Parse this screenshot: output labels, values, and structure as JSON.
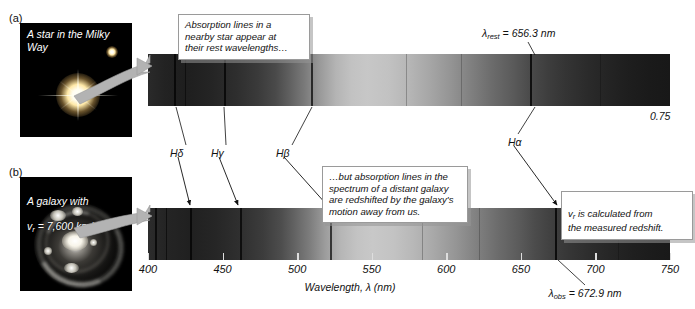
{
  "figure": {
    "type": "astronomy-spectra-comparison",
    "panels": [
      {
        "letter": "(a)",
        "caption": "A star in the Milky Way",
        "subject": "star"
      },
      {
        "letter": "(b)",
        "caption_line1": "A galaxy with",
        "caption_line2_pre": "v",
        "caption_line2_sub": "r",
        "caption_line2_post": " = 7,600 km/s",
        "subject": "galaxy"
      }
    ]
  },
  "photos": {
    "star": {
      "label": "A star in the Milky Way"
    },
    "galaxy": {
      "label_line1": "A galaxy with",
      "label_line2": "v_r = 7,600 km/s"
    }
  },
  "callouts": {
    "star_spectrum": "Absorption lines in a\nnearby star appear at\ntheir rest wavelengths…",
    "galaxy_spectrum": "…but absorption lines in the\nspectrum of a distant galaxy\nare redshifted by the galaxy's\nmotion away from us.",
    "vr_calculation_pre": "v",
    "vr_calculation_sub": "r",
    "vr_calculation_post": " is calculated from\nthe measured redshift."
  },
  "annotations": {
    "lambda_rest_pre": "λ",
    "lambda_rest_sub": "rest",
    "lambda_rest_post": " = 656.3 nm",
    "lambda_obs_pre": "λ",
    "lambda_obs_sub": "obs",
    "lambda_obs_post": " = 672.9 nm",
    "ratio": "0.75",
    "h_delta": "Hδ",
    "h_gamma": "Hγ",
    "h_beta": "Hβ",
    "h_alpha": "Hα"
  },
  "axis": {
    "title_pre": "Wavelength, ",
    "title_lambda": "λ",
    "title_post": " (nm)",
    "full_title": "Wavelength, λ (nm)",
    "ticks": [
      400,
      450,
      500,
      550,
      600,
      650,
      700,
      750
    ],
    "min": 400,
    "max": 750,
    "unit": "nm"
  },
  "chart_data": {
    "type": "heatmap",
    "xlabel": "Wavelength, λ (nm)",
    "ylabel": "",
    "xlim": [
      400,
      750
    ],
    "grid": false,
    "legend": "none",
    "series": [
      {
        "name": "A star in the Milky Way (rest frame)",
        "panel": "(a)",
        "absorption_lines": [
          {
            "id": "H-delta",
            "label": "Hδ",
            "wavelength_nm": 410.2,
            "depth": 0.55
          },
          {
            "id": "H-gamma",
            "label": "Hγ",
            "wavelength_nm": 434.0,
            "depth": 0.6
          },
          {
            "id": "H-beta",
            "label": "Hβ",
            "wavelength_nm": 486.1,
            "depth": 0.65
          },
          {
            "id": "H-alpha",
            "label": "Hα",
            "wavelength_nm": 656.3,
            "depth": 0.7
          }
        ],
        "marker": {
          "label": "λ_rest = 656.3 nm",
          "wavelength_nm": 656.3
        }
      },
      {
        "name": "A galaxy with v_r = 7,600 km/s (redshifted)",
        "panel": "(b)",
        "absorption_lines": [
          {
            "id": "H-delta",
            "label": "Hδ",
            "wavelength_nm": 420.6,
            "depth": 0.55
          },
          {
            "id": "H-gamma",
            "label": "Hγ",
            "wavelength_nm": 445.0,
            "depth": 0.6
          },
          {
            "id": "H-beta",
            "label": "Hβ",
            "wavelength_nm": 498.4,
            "depth": 0.65
          },
          {
            "id": "H-alpha",
            "label": "Hα",
            "wavelength_nm": 672.9,
            "depth": 0.7
          }
        ],
        "marker": {
          "label": "λ_obs = 672.9 nm",
          "wavelength_nm": 672.9
        }
      }
    ],
    "derived_values": {
      "lambda_rest_nm": 656.3,
      "lambda_obs_nm": 672.9,
      "radial_velocity_km_s": 7600,
      "ratio_label": "0.75"
    }
  },
  "colors": {
    "background": "#ffffff",
    "spectrum_dark": "#0a0a0a",
    "spectrum_light": "#c9c9c9",
    "callout_border": "#9a9a9a",
    "arrow_gray": "#b3b3b3",
    "text": "#111111"
  }
}
